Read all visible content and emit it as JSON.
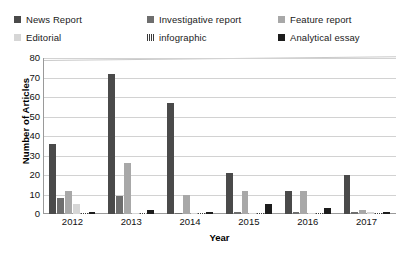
{
  "chart_data": {
    "type": "bar",
    "title": "",
    "xlabel": "Year",
    "ylabel": "Number of Articles",
    "categories": [
      "2012",
      "2013",
      "2014",
      "2015",
      "2016",
      "2017"
    ],
    "ylim": [
      0,
      80
    ],
    "yticks": [
      0,
      10,
      20,
      30,
      40,
      50,
      60,
      70,
      80
    ],
    "grid": true,
    "legend_position": "top",
    "series": [
      {
        "name": "News Report",
        "color": "#4a4a4a",
        "pattern": "solid",
        "values": [
          36,
          72,
          57,
          21,
          12,
          20
        ]
      },
      {
        "name": "Investigative report",
        "color": "#6e6e6e",
        "pattern": "solid",
        "values": [
          8,
          9,
          0,
          1,
          1,
          1
        ]
      },
      {
        "name": "Feature report",
        "color": "#a8a8a8",
        "pattern": "solid",
        "values": [
          12,
          26,
          10,
          12,
          12,
          2
        ]
      },
      {
        "name": "Editorial",
        "color": "#d6d6d6",
        "pattern": "solid",
        "values": [
          5,
          0,
          0,
          0,
          0,
          1
        ]
      },
      {
        "name": "infographic",
        "color": "#3a3a3a",
        "pattern": "hatch",
        "values": [
          0,
          0,
          0,
          0,
          0,
          0
        ]
      },
      {
        "name": "Analytical essay",
        "color": "#1c1c1c",
        "pattern": "solid",
        "values": [
          1,
          2,
          1,
          5,
          3,
          1
        ]
      }
    ]
  },
  "legend": {
    "rows": [
      [
        "News Report",
        "Investigative report",
        "Feature report"
      ],
      [
        "Editorial",
        "infographic",
        "Analytical essay"
      ]
    ]
  }
}
